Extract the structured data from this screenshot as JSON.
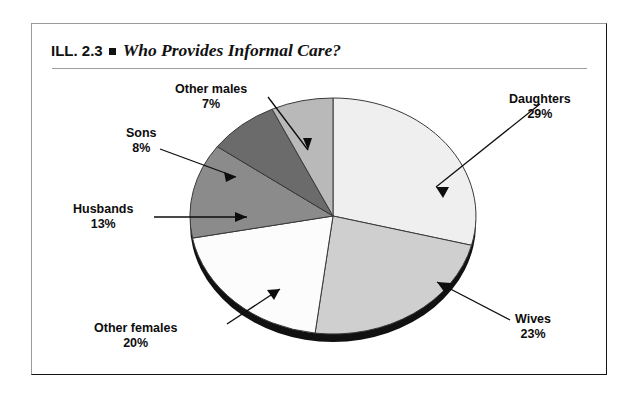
{
  "figure": {
    "label_prefix": "ILL. 2.3",
    "bullet": "square-bullet",
    "title": "Who Provides Informal Care?"
  },
  "chart_data": {
    "type": "pie",
    "title": "Who Provides Informal Care?",
    "xlabel": "",
    "ylabel": "",
    "legend_position": "none",
    "labels_inline": true,
    "start_angle_deg": 0,
    "direction": "clockwise",
    "categories": [
      "Daughters",
      "Wives",
      "Other females",
      "Husbands",
      "Sons",
      "Other males"
    ],
    "values": [
      29,
      23,
      20,
      13,
      8,
      7
    ],
    "value_suffix": "%",
    "colors": [
      "#efefef",
      "#cfcfcf",
      "#fcfcfc",
      "#8b8b8b",
      "#6b6b6b",
      "#b9b9b9"
    ],
    "slices": [
      {
        "name": "Daughters",
        "value": 29,
        "value_text": "29%",
        "color": "#efefef"
      },
      {
        "name": "Wives",
        "value": 23,
        "value_text": "23%",
        "color": "#cfcfcf"
      },
      {
        "name": "Other females",
        "value": 20,
        "value_text": "20%",
        "color": "#fcfcfc"
      },
      {
        "name": "Husbands",
        "value": 13,
        "value_text": "13%",
        "color": "#8b8b8b"
      },
      {
        "name": "Sons",
        "value": 8,
        "value_text": "8%",
        "color": "#6b6b6b"
      },
      {
        "name": "Other males",
        "value": 7,
        "value_text": "7%",
        "color": "#b9b9b9"
      }
    ]
  },
  "callouts": {
    "daughters": {
      "name": "Daughters",
      "pct": "29%"
    },
    "wives": {
      "name": "Wives",
      "pct": "23%"
    },
    "other_females": {
      "name": "Other females",
      "pct": "20%"
    },
    "husbands": {
      "name": "Husbands",
      "pct": "13%"
    },
    "sons": {
      "name": "Sons",
      "pct": "8%"
    },
    "other_males": {
      "name": "Other males",
      "pct": "7%"
    }
  }
}
